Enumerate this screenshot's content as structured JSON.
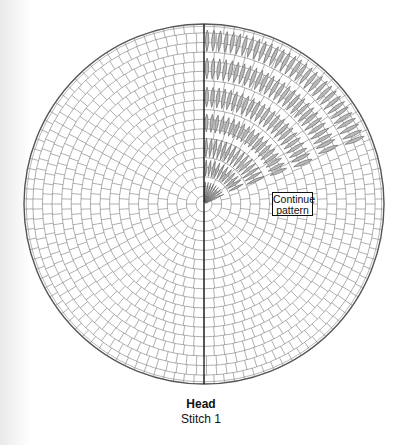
{
  "diagram": {
    "title": "Head",
    "subtitle": "Stitch 1",
    "annotation": {
      "line1": "Continue",
      "line2": "pattern"
    },
    "colors": {
      "grid_line": "#6e6e6e",
      "outer_ring": "#555555",
      "center_axis": "#111111",
      "stitch_fill": "#b9b9b9",
      "stitch_stroke": "#5a5a5a"
    },
    "geometry": {
      "center": [
        204,
        204
      ],
      "outer_radius": 180,
      "inner_radius": 8,
      "ring_spacing": 9.6,
      "cell_size": 10,
      "pattern_wedge_deg": [
        22,
        90
      ]
    },
    "stitch_bands": [
      {
        "r0": 2,
        "r1": 22,
        "spacing_deg": 7.5
      },
      {
        "r0": 28,
        "r1": 44,
        "spacing_deg": 6
      },
      {
        "r0": 47,
        "r1": 66,
        "spacing_deg": 4.5
      },
      {
        "r0": 72,
        "r1": 90,
        "spacing_deg": 3.6
      },
      {
        "r0": 97,
        "r1": 117,
        "spacing_deg": 3
      },
      {
        "r0": 125,
        "r1": 146,
        "spacing_deg": 2.5
      },
      {
        "r0": 153,
        "r1": 174,
        "spacing_deg": 2.2
      }
    ]
  }
}
